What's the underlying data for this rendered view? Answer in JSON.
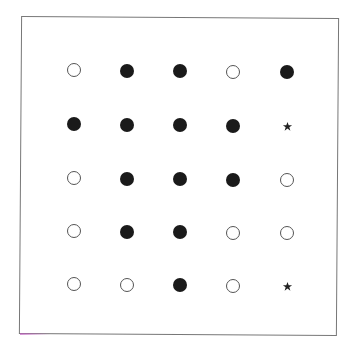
{
  "figure": {
    "type": "dot-grid",
    "rows": 5,
    "cols": 5,
    "legend_symbols": {
      "filled": "filled-circle",
      "open": "open-circle",
      "star": "star"
    },
    "grid": [
      [
        "open",
        "filled",
        "filled",
        "open",
        "filled"
      ],
      [
        "filled",
        "filled",
        "filled",
        "filled",
        "star"
      ],
      [
        "open",
        "filled",
        "filled",
        "filled",
        "open"
      ],
      [
        "open",
        "filled",
        "filled",
        "open",
        "open"
      ],
      [
        "open",
        "open",
        "filled",
        "open",
        "star"
      ]
    ],
    "colors": {
      "filled": "#1a1a1a",
      "open_stroke": "#555555",
      "frame": "#777777"
    }
  }
}
